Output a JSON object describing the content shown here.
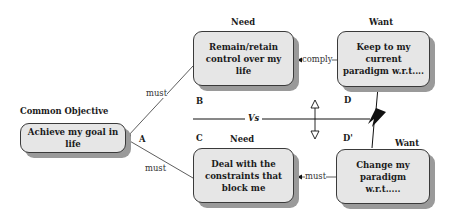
{
  "diagram": {
    "type": "evaporating-cloud",
    "objective": {
      "heading": "Common Objective",
      "text": "Achieve my goal in life",
      "letter": "A"
    },
    "need_b": {
      "heading": "Need",
      "text": "Remain/retain control over my life",
      "letter": "B"
    },
    "want_d": {
      "heading": "Want",
      "text": "Keep to my current paradigm w.r.t....",
      "letter": "D"
    },
    "need_c": {
      "heading": "Need",
      "text": "Deal with the constraints that block me",
      "letter": "C"
    },
    "want_d_prime": {
      "heading": "Want",
      "text": "Change my paradigm w.r.t.....",
      "letter": "D'"
    },
    "connectors": {
      "a_to_b": "must",
      "a_to_c": "must",
      "b_to_d": "comply",
      "c_to_d_prime": "must",
      "vs": "Vs"
    },
    "colors": {
      "box_fill": "#e6e6e6",
      "box_border": "#3a3a3a",
      "shadow": "#9a9a9a",
      "line": "#1a1a1a"
    }
  }
}
